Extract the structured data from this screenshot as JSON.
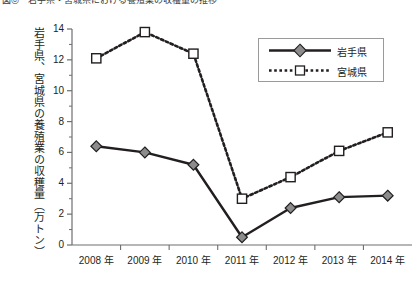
{
  "caption": "図◎　岩手県・宮城県における養殖業の収穫量の推移",
  "axis": {
    "y_title": "岩手県、宮城県の養殖業の収穫量（万トン）",
    "y_ticks": [
      "0",
      "2",
      "4",
      "6",
      "8",
      "10",
      "12",
      "14"
    ],
    "x_ticks": [
      "2008 年",
      "2009 年",
      "2010 年",
      "2011 年",
      "2012 年",
      "2013 年",
      "2014 年"
    ]
  },
  "legend": {
    "items": [
      {
        "label": "岩手県",
        "style": "solid-diamond",
        "color": "#231f20",
        "marker_fill": "#8c8c8c"
      },
      {
        "label": "宮城県",
        "style": "dotted-square",
        "color": "#231f20",
        "marker_fill": "#ffffff"
      }
    ]
  },
  "chart_data": {
    "type": "line",
    "title": "岩手県・宮城県における養殖業の収穫量の推移",
    "xlabel": "",
    "ylabel": "岩手県、宮城県の養殖業の収穫量（万トン）",
    "categories": [
      "2008 年",
      "2009 年",
      "2010 年",
      "2011 年",
      "2012 年",
      "2013 年",
      "2014 年"
    ],
    "ylim": [
      0,
      14
    ],
    "ytick_step": 2,
    "yminor_step": 1,
    "grid": false,
    "legend_position": "top-right",
    "series": [
      {
        "name": "岩手県",
        "line": "solid",
        "marker": "diamond",
        "color": "#231f20",
        "marker_fill": "#8c8c8c",
        "values": [
          6.4,
          6.0,
          5.2,
          0.5,
          2.4,
          3.1,
          3.2
        ]
      },
      {
        "name": "宮城県",
        "line": "dotted",
        "marker": "square",
        "color": "#231f20",
        "marker_fill": "#ffffff",
        "values": [
          12.1,
          13.8,
          12.4,
          3.0,
          4.4,
          6.1,
          7.3
        ]
      }
    ]
  }
}
